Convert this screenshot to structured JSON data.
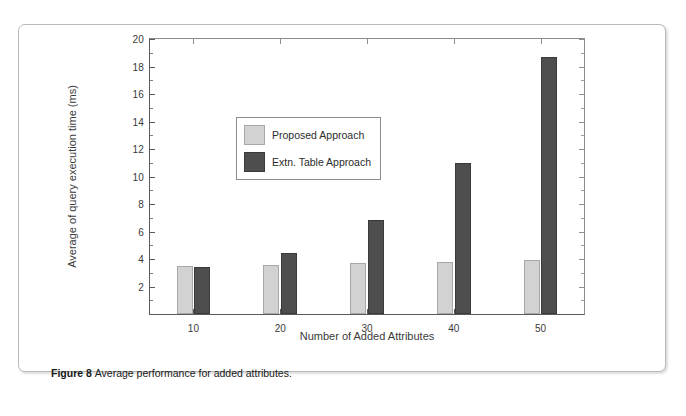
{
  "figure": {
    "caption_label": "Figure 8",
    "caption_text": "Average performance for added attributes."
  },
  "colors": {
    "series_proposed": "#d2d2d2",
    "series_extn_table": "#4e4e4e",
    "axis": "#5a5a5a",
    "card_border": "#b9b9b9",
    "background": "#ffffff"
  },
  "chart_data": {
    "type": "bar",
    "title": "",
    "xlabel": "Number of Added Attributes",
    "ylabel": "Average of query execution time (ms)",
    "categories": [
      "10",
      "20",
      "30",
      "40",
      "50"
    ],
    "series": [
      {
        "name": "Proposed Approach",
        "color": "#d2d2d2",
        "values": [
          3.5,
          3.55,
          3.7,
          3.8,
          3.9
        ]
      },
      {
        "name": "Extn. Table Approach",
        "color": "#4e4e4e",
        "values": [
          3.4,
          4.45,
          6.85,
          11.0,
          18.7
        ]
      }
    ],
    "ylim": [
      0,
      20
    ],
    "y_ticks": [
      2,
      4,
      6,
      8,
      10,
      12,
      14,
      16,
      18,
      20
    ],
    "y_minor_ticks": [
      1,
      3,
      5,
      7,
      9,
      11,
      13,
      15,
      17,
      19
    ],
    "x_ticks": [
      "10",
      "20",
      "30",
      "40",
      "50"
    ],
    "grid": false,
    "legend_position": "upper left",
    "legend_entries": [
      "Proposed Approach",
      "Extn. Table Approach"
    ]
  }
}
